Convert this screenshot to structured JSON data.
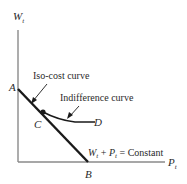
{
  "diagram": {
    "axes": {
      "y_label": "W",
      "y_label_sub": "t",
      "x_label": "P",
      "x_label_sub": "t",
      "axis_color": "#8a8a8a"
    },
    "points": {
      "A": "A",
      "B": "B",
      "C": "C",
      "D": "D"
    },
    "labels": {
      "iso_cost": "Iso-cost curve",
      "indifference": "Indifference curve",
      "constraint_w": "W",
      "constraint_w_sub": "t",
      "constraint_plus": " + ",
      "constraint_p": "P",
      "constraint_p_sub": "t",
      "constraint_rest": " = Constant"
    },
    "colors": {
      "line": "#1a1a1a",
      "text": "#2a2a2a"
    }
  }
}
